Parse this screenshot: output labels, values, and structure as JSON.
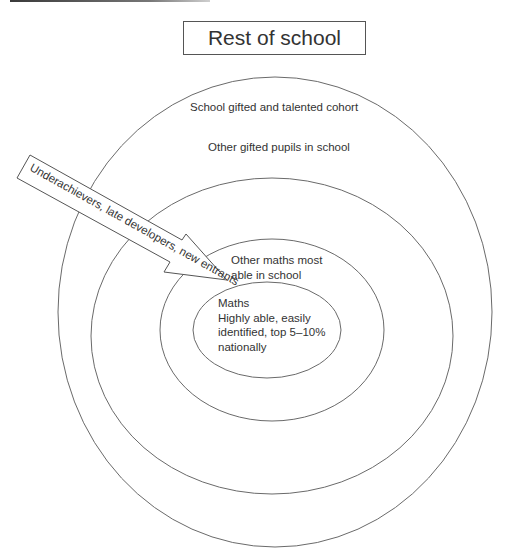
{
  "title": "Rest of school",
  "rings": [
    {
      "id": "outer",
      "label": "School gifted and talented cohort"
    },
    {
      "id": "gifted",
      "label": "Other gifted pupils in school"
    },
    {
      "id": "maths-able",
      "label_lines": [
        "Other maths most",
        "able in school"
      ]
    },
    {
      "id": "maths-core",
      "label_lines": [
        "Maths",
        "Highly able, easily",
        "identified, top 5–10%",
        "nationally"
      ]
    }
  ],
  "arrow": {
    "label": "Underachievers, late developers, new entrants"
  },
  "colors": {
    "stroke": "#666666",
    "text": "#333333",
    "background": "#ffffff"
  }
}
